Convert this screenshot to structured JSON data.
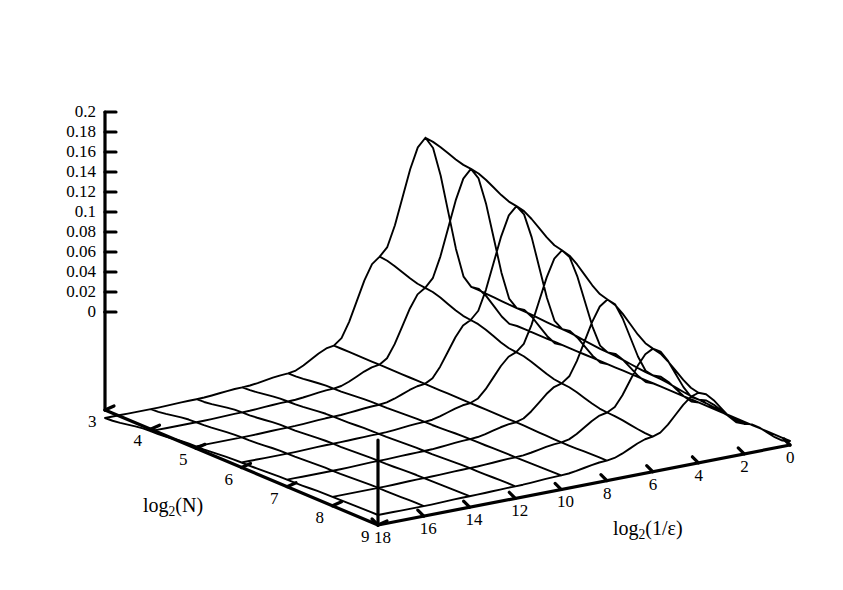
{
  "chart_data": {
    "type": "line",
    "render": "3d-wireframe-surface",
    "title": "",
    "xlabel": "log2(N)",
    "ylabel": "log2(1/ε)",
    "zlabel": "",
    "grid": false,
    "axes": {
      "x": {
        "name": "log2(N)",
        "label_html": "log<sub>2</sub>(N)",
        "ticks": [
          3,
          4,
          5,
          6,
          7,
          8,
          9
        ],
        "tick_labels": [
          "3",
          "4",
          "5",
          "6",
          "7",
          "8",
          "9"
        ],
        "range": [
          3,
          9
        ],
        "direction": "increasing-toward-front"
      },
      "y": {
        "name": "log2(1/epsilon)",
        "label_html": "log<sub>2</sub>(1/ε)",
        "ticks": [
          18,
          16,
          14,
          12,
          10,
          8,
          6,
          4,
          2,
          0
        ],
        "tick_labels": [
          "18",
          "16",
          "14",
          "12",
          "10",
          "8",
          "6",
          "4",
          "2",
          "0"
        ],
        "range": [
          18,
          0
        ],
        "direction": "decreasing-toward-right"
      },
      "z": {
        "ticks": [
          0,
          0.02,
          0.04,
          0.06,
          0.08,
          0.1,
          0.12,
          0.14,
          0.16,
          0.18,
          0.2
        ],
        "tick_labels": [
          "0",
          "0.02",
          "0.04",
          "0.06",
          "0.08",
          "0.1",
          "0.12",
          "0.14",
          "0.16",
          "0.18",
          "0.2"
        ],
        "range": [
          0,
          0.2
        ]
      }
    },
    "x": [
      3,
      4,
      5,
      6,
      7,
      8,
      9
    ],
    "y": [
      18,
      16,
      14,
      12,
      10,
      8,
      6,
      4,
      2,
      0
    ],
    "z_matrix": [
      [
        0.01,
        0.01,
        0.011,
        0.012,
        0.014,
        0.02,
        0.035,
        0.07,
        0.03,
        0.004
      ],
      [
        0.009,
        0.009,
        0.01,
        0.011,
        0.013,
        0.019,
        0.04,
        0.095,
        0.035,
        0.004
      ],
      [
        0.007,
        0.007,
        0.008,
        0.009,
        0.012,
        0.02,
        0.05,
        0.125,
        0.04,
        0.004
      ],
      [
        0.005,
        0.005,
        0.006,
        0.007,
        0.01,
        0.02,
        0.062,
        0.155,
        0.044,
        0.004
      ],
      [
        0.002,
        0.002,
        0.003,
        0.005,
        0.008,
        0.02,
        0.075,
        0.18,
        0.048,
        0.004
      ],
      [
        -0.002,
        -0.002,
        -0.001,
        0.001,
        0.005,
        0.02,
        0.088,
        0.198,
        0.05,
        0.004
      ],
      [
        -0.008,
        -0.008,
        -0.007,
        -0.004,
        0.001,
        0.02,
        0.1,
        0.21,
        0.052,
        0.004
      ]
    ]
  }
}
